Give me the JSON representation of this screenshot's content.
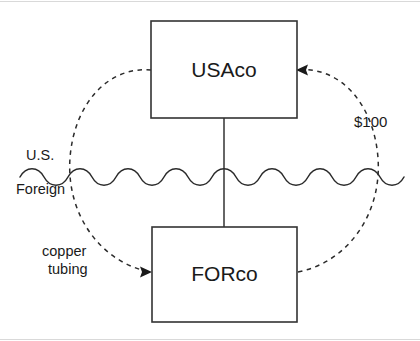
{
  "diagram": {
    "entities": [
      {
        "id": "usaco",
        "label": "USAco",
        "x": 151,
        "y": 21,
        "w": 146,
        "h": 97
      },
      {
        "id": "forco",
        "label": "FORco",
        "x": 152,
        "y": 227,
        "w": 145,
        "h": 95
      }
    ],
    "border_labels": {
      "upper": "U.S.",
      "lower": "Foreign"
    },
    "flows": [
      {
        "id": "goods-flow",
        "label": "copper tubing",
        "from": "USAco",
        "to": "FORco",
        "direction": "usaco-to-forco",
        "style": "dashed"
      },
      {
        "id": "payment-flow",
        "label": "$100",
        "from": "FORco",
        "to": "USAco",
        "direction": "forco-to-usaco",
        "style": "dashed"
      }
    ],
    "ownership_link": {
      "from": "USAco",
      "to": "FORco",
      "style": "solid"
    },
    "colors": {
      "stroke": "#333333",
      "text": "#1a1a1a",
      "background": "#ffffff",
      "edge_rule": "#d9d9d9"
    }
  }
}
